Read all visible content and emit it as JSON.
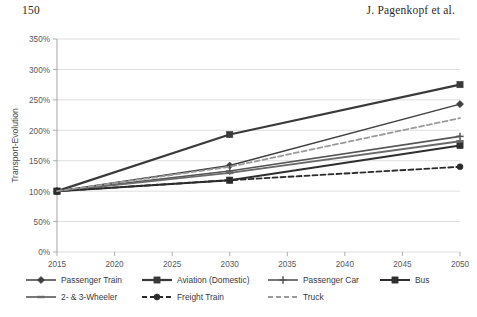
{
  "page": {
    "number": "150",
    "running_head": "J. Pagenkopf et al."
  },
  "chart_data": {
    "type": "line",
    "title": "",
    "xlabel": "",
    "ylabel": "Transport-Evolution",
    "x": [
      2015,
      2020,
      2025,
      2030,
      2035,
      2040,
      2045,
      2050
    ],
    "xtick_labels": [
      "2015",
      "2020",
      "2025",
      "2030",
      "2035",
      "2040",
      "2045",
      "2050"
    ],
    "xlim": [
      2015,
      2050
    ],
    "ylim": [
      0,
      350
    ],
    "ytick_labels": [
      "0%",
      "50%",
      "100%",
      "150%",
      "200%",
      "250%",
      "300%",
      "350%"
    ],
    "ytick_values": [
      0,
      50,
      100,
      150,
      200,
      250,
      300,
      350
    ],
    "grid": "horizontal",
    "legend_position": "below",
    "series": [
      {
        "name": "Passenger Train",
        "marker": "diamond",
        "dash": "solid",
        "color": "#404040",
        "width": 1.5,
        "points": [
          {
            "x": 2015,
            "y": 100
          },
          {
            "x": 2030,
            "y": 142
          },
          {
            "x": 2050,
            "y": 243
          }
        ]
      },
      {
        "name": "Aviation (Domestic)",
        "marker": "square",
        "dash": "solid",
        "color": "#3a3a3a",
        "width": 2.2,
        "points": [
          {
            "x": 2015,
            "y": 100
          },
          {
            "x": 2030,
            "y": 193
          },
          {
            "x": 2050,
            "y": 275
          }
        ]
      },
      {
        "name": "Passenger Car",
        "marker": "plus",
        "dash": "solid",
        "color": "#555555",
        "width": 1.6,
        "points": [
          {
            "x": 2015,
            "y": 100
          },
          {
            "x": 2030,
            "y": 133
          },
          {
            "x": 2050,
            "y": 190
          }
        ]
      },
      {
        "name": "Bus",
        "marker": "square",
        "dash": "solid",
        "color": "#2f2f2f",
        "width": 2.0,
        "points": [
          {
            "x": 2015,
            "y": 100
          },
          {
            "x": 2030,
            "y": 118
          },
          {
            "x": 2050,
            "y": 175
          }
        ]
      },
      {
        "name": "2- & 3-Wheeler",
        "marker": "dash",
        "dash": "solid",
        "color": "#6a6a6a",
        "width": 1.8,
        "points": [
          {
            "x": 2015,
            "y": 100
          },
          {
            "x": 2030,
            "y": 130
          },
          {
            "x": 2050,
            "y": 182
          }
        ]
      },
      {
        "name": "Freight Train",
        "marker": "circle",
        "dash": "dashed",
        "color": "#2b2b2b",
        "width": 1.8,
        "points": [
          {
            "x": 2015,
            "y": 100
          },
          {
            "x": 2030,
            "y": 118
          },
          {
            "x": 2050,
            "y": 140
          }
        ]
      },
      {
        "name": "Truck",
        "marker": "none",
        "dash": "dashed",
        "color": "#9a9a9a",
        "width": 1.8,
        "points": [
          {
            "x": 2015,
            "y": 100
          },
          {
            "x": 2030,
            "y": 140
          },
          {
            "x": 2050,
            "y": 220
          }
        ]
      }
    ]
  },
  "legend": {
    "row1": [
      "Passenger Train",
      "Aviation (Domestic)",
      "Passenger Car",
      "Bus"
    ],
    "row2": [
      "2- & 3-Wheeler",
      "Freight Train",
      "Truck"
    ]
  }
}
